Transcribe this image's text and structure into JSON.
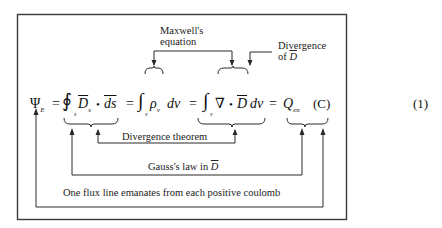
{
  "equation": {
    "lhs_symbol": "Ψ",
    "lhs_subscript": "E",
    "equals": "=",
    "surface_integral_symbol": "∮",
    "surface_limit": "s",
    "field_D": "D",
    "field_D_subscript": "s",
    "dot": "•",
    "ds": "ds",
    "volume_integral_symbol": "∫",
    "volume_limit": "v",
    "rho": "ρ",
    "rho_subscript": "v",
    "dv": "dv",
    "nabla": "∇",
    "charge": "Q",
    "charge_subscript": "en",
    "unit": "(C)",
    "number": "(1)"
  },
  "annotations": {
    "maxwell_line1": "Maxwell's",
    "maxwell_line2": "equation",
    "divergence_of_d_line1": "Divergence",
    "divergence_of_d_line2_prefix": "of ",
    "divergence_of_d_line2_symbol": "D",
    "divergence_theorem": "Divergence theorem",
    "gauss_law_prefix": "Gauss's law in ",
    "gauss_law_symbol": "D",
    "flux_line": "One flux line emanates from each positive coulomb"
  },
  "colors": {
    "frame": "#3a3a3a",
    "lines": "#2a2a2a",
    "text": "#1a1a1a",
    "background": "#ffffff"
  }
}
